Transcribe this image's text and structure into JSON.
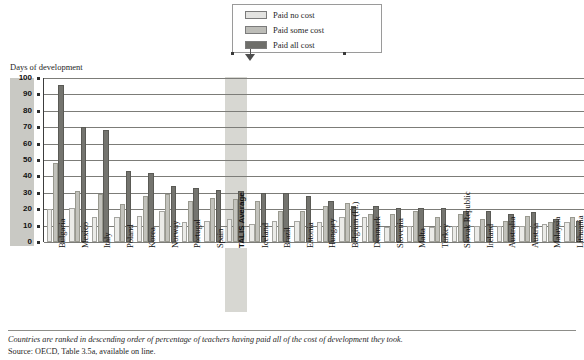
{
  "legend": {
    "items": [
      {
        "label": "Paid no cost",
        "key": "none",
        "color": "#e3e3e1"
      },
      {
        "label": "Paid some cost",
        "key": "some",
        "color": "#bdbdb8"
      },
      {
        "label": "Paid all cost",
        "key": "all",
        "color": "#6e6e6a"
      }
    ]
  },
  "axis_title": "Days of development",
  "footnote": "Countries are ranked in descending order of percentage of teachers having paid all of the cost of development they took.",
  "source": "Source: OECD, Table 3.5a, available on line.",
  "highlight_category": "TALIS Average",
  "chart_data": {
    "type": "bar",
    "title": "",
    "xlabel": "",
    "ylabel": "Days of development",
    "ylim": [
      0,
      100
    ],
    "yticks": [
      0,
      10,
      20,
      30,
      40,
      50,
      60,
      70,
      80,
      90,
      100
    ],
    "grid": true,
    "legend_position": "top-right",
    "categories": [
      "Bulgaria",
      "Mexico",
      "Italy",
      "Poland",
      "Korea",
      "Norway",
      "Portugal",
      "Spain",
      "TALIS Average",
      "Iceland",
      "Brazil",
      "Estonia",
      "Hungary",
      "Belgium (Fl.)",
      "Denmark",
      "Slovenia",
      "Malta",
      "Turkey",
      "Slovak Republic",
      "Ireland",
      "Australia",
      "Austria",
      "Malaysia",
      "Lithuania"
    ],
    "series": [
      {
        "name": "Paid no cost",
        "color": "#ebebe8",
        "values": [
          20,
          21,
          15,
          15,
          16,
          19,
          12,
          13,
          14,
          11,
          13,
          13,
          12,
          15,
          15,
          9,
          10,
          9,
          10,
          10,
          10,
          10,
          11,
          12
        ]
      },
      {
        "name": "Paid some cost",
        "color": "#c2c2bc",
        "values": [
          48,
          31,
          29,
          23,
          28,
          29,
          25,
          27,
          26,
          25,
          19,
          19,
          22,
          24,
          17,
          17,
          19,
          15,
          17,
          14,
          13,
          16,
          12,
          15
        ]
      },
      {
        "name": "Paid all cost",
        "color": "#74746f",
        "values": [
          96,
          70,
          68,
          43,
          42,
          34,
          33,
          32,
          31,
          30,
          30,
          28,
          25,
          22,
          22,
          21,
          21,
          21,
          19,
          19,
          17,
          18,
          14,
          13
        ]
      }
    ]
  }
}
